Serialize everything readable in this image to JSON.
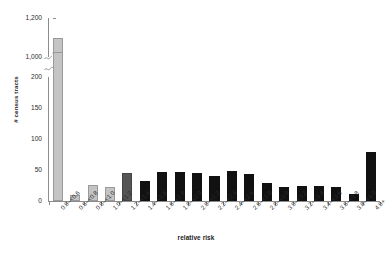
{
  "chart_data": {
    "type": "bar",
    "title": "",
    "xlabel": "relative risk",
    "ylabel": "# census tracts",
    "grid": false,
    "legend": "none",
    "axis_break": {
      "present": true,
      "lower_range": [
        0,
        200
      ],
      "upper_range": [
        1000,
        1200
      ]
    },
    "ylim": [
      0,
      200
    ],
    "y_ticks_lower": [
      "0",
      "50",
      "100",
      "150",
      "200"
    ],
    "y_ticks_upper": [
      "1,000",
      "1,200"
    ],
    "y_tick_values_lower": [
      0,
      50,
      100,
      150,
      200
    ],
    "y_tick_values_upper": [
      1000,
      1200
    ],
    "categories": [
      "0.0–<0.6",
      "0.6–<0.8",
      "0.8–<1.0",
      "1.0–<1.2",
      "1.2–<1.4",
      "1.4–<1.6",
      "1.6–<1.8",
      "1.8–<2.0",
      "2.0–<2.2",
      "2.2–<2.4",
      "2.4–<2.6",
      "2.6–<2.8",
      "2.8–<3.0",
      "3.0–<3.2",
      "3.2–<3.4",
      "3.4–<3.6",
      "3.6–<3.8",
      "3.8–<4.0",
      "4.0+"
    ],
    "values": [
      1100,
      9,
      26,
      22,
      45,
      32,
      46,
      47,
      45,
      41,
      48,
      44,
      29,
      23,
      25,
      24,
      22,
      12,
      79
    ],
    "bar_colors": [
      "#c4c4c4",
      "#c4c4c4",
      "#c4c4c4",
      "#c4c4c4",
      "#555555",
      "#111111",
      "#111111",
      "#111111",
      "#111111",
      "#111111",
      "#111111",
      "#111111",
      "#111111",
      "#111111",
      "#111111",
      "#111111",
      "#111111",
      "#111111",
      "#111111"
    ]
  },
  "axis_colors": {
    "axis_line": "#8c8c8c",
    "tick_text": "#2b2b2b",
    "title_text": "#1a1a1a"
  }
}
